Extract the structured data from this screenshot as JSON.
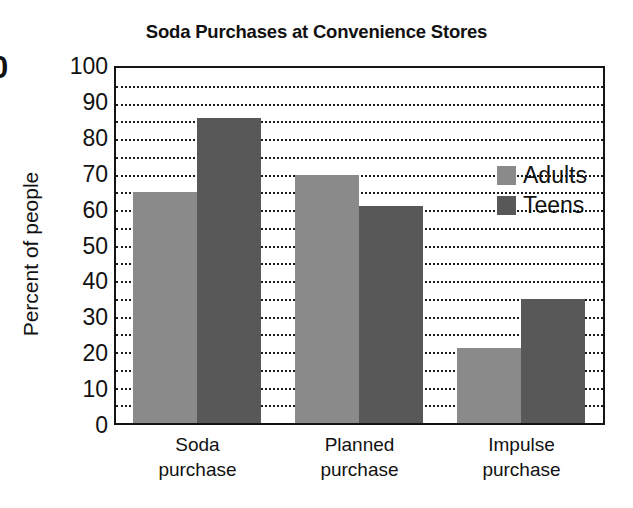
{
  "chart_data": {
    "type": "bar",
    "title": "Soda Purchases at Convenience Stores",
    "xlabel": "",
    "ylabel": "Percent of people",
    "ylim": [
      0,
      100
    ],
    "ytick_step": 10,
    "gridline_step": 5,
    "grid": true,
    "grid_style": "dotted",
    "legend_position": "upper-right-inside",
    "categories": [
      "Soda purchase",
      "Planned purchase",
      "Impulse purchase"
    ],
    "category_lines": [
      [
        "Soda",
        "purchase"
      ],
      [
        "Planned",
        "purchase"
      ],
      [
        "Impulse",
        "purchase"
      ]
    ],
    "series": [
      {
        "name": "Adults",
        "color": "#8a8a8a",
        "values": [
          65,
          70,
          21
        ]
      },
      {
        "name": "Teens",
        "color": "#585858",
        "values": [
          86,
          61,
          35
        ]
      }
    ],
    "ytick_labels": [
      "100",
      "90",
      "80",
      "70",
      "60",
      "50",
      "40",
      "30",
      "20",
      "10",
      "0"
    ],
    "ytick_values": [
      100,
      90,
      80,
      70,
      60,
      50,
      40,
      30,
      20,
      10,
      0
    ]
  },
  "legend": {
    "items": [
      {
        "label": "Adults",
        "color": "#8a8a8a"
      },
      {
        "label": "Teens",
        "color": "#585858"
      }
    ]
  },
  "artifacts": {
    "edge_glyph": "0"
  },
  "colors": {
    "adults": "#8a8a8a",
    "teens": "#585858",
    "axis": "#141414",
    "grid": "#1b1b1b",
    "text": "#111111",
    "background": "#ffffff"
  }
}
